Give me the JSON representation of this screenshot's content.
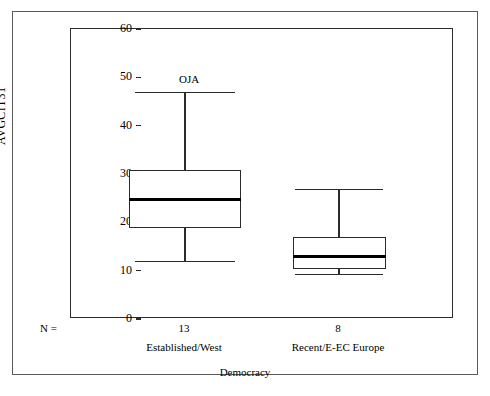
{
  "chart_data": {
    "type": "box",
    "title": "",
    "xlabel": "Democracy",
    "ylabel": "AVGCIT31",
    "ylim": [
      0,
      60
    ],
    "yticks": [
      0,
      10,
      20,
      30,
      40,
      50,
      60
    ],
    "ytick_labels": [
      "0",
      "10",
      "20",
      "30",
      "40",
      "50",
      "60"
    ],
    "grid": false,
    "legend": "none",
    "n_label": "N =",
    "categories": [
      "Established/West",
      "Recent/E-EC Europe"
    ],
    "counts": [
      "13",
      "8"
    ],
    "boxes": [
      {
        "category": "Established/West",
        "n": "13",
        "whisker_low": 12.0,
        "q1": 18.8,
        "median": 24.8,
        "q3": 30.8,
        "whisker_high": 47.0,
        "outlier_label": "OJA"
      },
      {
        "category": "Recent/E-EC Europe",
        "n": "8",
        "whisker_low": 9.3,
        "q1": 10.3,
        "median": 13.0,
        "q3": 17.0,
        "whisker_high": 26.9,
        "outlier_label": ""
      }
    ],
    "colors": {
      "axis": "#2b2b2b",
      "frame": "#5a5a5a",
      "box_fill": "#ffffff",
      "median": "#000000",
      "text": "#000000"
    }
  }
}
